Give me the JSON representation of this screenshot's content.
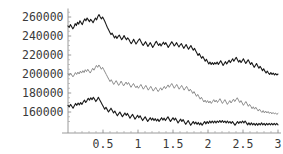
{
  "chart_data": {
    "type": "line",
    "title": "",
    "subtitle": "",
    "xlabel": "",
    "ylabel": "",
    "xlim": [
      0,
      3
    ],
    "ylim": [
      145000,
      268000
    ],
    "grid": false,
    "legend": "none",
    "axis_origin_y": 150000,
    "xticks": [
      0.5,
      1,
      1.5,
      2,
      2.5,
      3
    ],
    "xtick_labels": [
      "0.5",
      "1",
      "1.5",
      "2",
      "2.5",
      "3"
    ],
    "yticks": [
      160000,
      180000,
      200000,
      220000,
      240000,
      260000
    ],
    "ytick_labels": [
      "160000",
      "180000",
      "200000",
      "220000",
      "240000",
      "260000"
    ],
    "x_start": 0,
    "x_end": 3,
    "series": [
      {
        "name": "upper-path",
        "color": "#1a1a1a",
        "width": 1.1,
        "values": [
          250500,
          249000,
          252000,
          250000,
          247500,
          249500,
          253000,
          251000,
          254500,
          252500,
          256000,
          254000,
          252000,
          255500,
          258000,
          256000,
          259000,
          257000,
          255000,
          257500,
          256000,
          254000,
          256500,
          259000,
          257000,
          260500,
          262500,
          260000,
          258000,
          260000,
          257500,
          255000,
          252000,
          249000,
          246500,
          244000,
          241500,
          243000,
          240500,
          238000,
          240000,
          237500,
          239500,
          241000,
          238500,
          236000,
          238000,
          240500,
          238000,
          236000,
          238000,
          236500,
          234000,
          232000,
          234000,
          236500,
          234000,
          231500,
          233500,
          235500,
          237000,
          234500,
          232000,
          230000,
          232000,
          234000,
          231500,
          229000,
          231000,
          233000,
          230500,
          228000,
          230000,
          232500,
          234500,
          232000,
          230000,
          232000,
          229500,
          231500,
          233500,
          231000,
          233000,
          230500,
          228000,
          230000,
          232000,
          234000,
          232000,
          229500,
          231000,
          233000,
          230500,
          228500,
          230500,
          232000,
          229500,
          227000,
          229000,
          231000,
          228500,
          226000,
          228000,
          230000,
          227500,
          225000,
          227000,
          224500,
          222000,
          219500,
          221500,
          219000,
          216500,
          218500,
          216000,
          213500,
          215500,
          213000,
          210500,
          212500,
          210000,
          212000,
          210000,
          212000,
          210500,
          212500,
          210000,
          212000,
          214000,
          211500,
          209000,
          211000,
          213000,
          210500,
          212500,
          214500,
          212000,
          214000,
          216000,
          213500,
          215500,
          217500,
          215000,
          212500,
          214500,
          212000,
          214000,
          216000,
          213500,
          211000,
          213000,
          215000,
          212500,
          210000,
          212000,
          209500,
          207000,
          209000,
          211000,
          208500,
          206000,
          208000,
          206000,
          203500,
          205500,
          203000,
          201000,
          203000,
          201000,
          199500,
          201500,
          199500,
          201000,
          199000,
          200500,
          199000,
          200000
        ]
      },
      {
        "name": "middle-path",
        "color": "#8c8c8c",
        "width": 1.0,
        "values": [
          200000,
          198500,
          201000,
          199000,
          197000,
          199000,
          201500,
          199500,
          202000,
          200000,
          203000,
          201000,
          203500,
          201500,
          204500,
          202500,
          205000,
          203000,
          201000,
          203500,
          206000,
          204000,
          206500,
          209000,
          207000,
          209500,
          207500,
          205000,
          207000,
          204500,
          202000,
          199500,
          197000,
          194500,
          192000,
          194000,
          191500,
          189000,
          191000,
          193000,
          190500,
          188000,
          190000,
          192500,
          190000,
          187500,
          189500,
          191500,
          189000,
          191000,
          188500,
          186000,
          188000,
          190000,
          187500,
          185500,
          187500,
          185000,
          187000,
          189000,
          186500,
          184000,
          186000,
          188000,
          185500,
          183000,
          185000,
          187000,
          184500,
          182000,
          184000,
          186000,
          183500,
          181500,
          183500,
          185500,
          183000,
          185000,
          187000,
          184500,
          186500,
          188500,
          186000,
          188000,
          190000,
          187500,
          185000,
          187000,
          189000,
          186500,
          184000,
          186000,
          188000,
          185500,
          183000,
          185000,
          187000,
          184500,
          182000,
          184000,
          182000,
          179500,
          181500,
          179000,
          176500,
          178500,
          176000,
          173500,
          175500,
          173000,
          170500,
          172500,
          170000,
          172000,
          169500,
          171500,
          169000,
          171000,
          173000,
          170500,
          172500,
          170000,
          172000,
          174000,
          171500,
          169000,
          171000,
          173000,
          170500,
          168000,
          170000,
          172000,
          169500,
          171500,
          173500,
          171000,
          173000,
          175000,
          172500,
          170000,
          172000,
          169500,
          167000,
          169000,
          171000,
          168500,
          166000,
          168000,
          166000,
          163500,
          165500,
          163000,
          165000,
          163000,
          161000,
          163000,
          161000,
          159500,
          161500,
          159000,
          161000,
          159000,
          160500,
          158500,
          160000,
          158000,
          159500,
          158000,
          159000,
          157500,
          158500
        ]
      },
      {
        "name": "lower-path",
        "color": "#1a1a1a",
        "width": 1.1,
        "values": [
          167000,
          165500,
          168000,
          166000,
          164000,
          166500,
          169000,
          167000,
          169500,
          167500,
          170000,
          168000,
          170500,
          172500,
          170000,
          172000,
          174500,
          172500,
          175000,
          173000,
          175500,
          173500,
          171000,
          173000,
          175500,
          173000,
          170500,
          168000,
          165500,
          163000,
          165000,
          162500,
          160000,
          162000,
          164000,
          161500,
          159000,
          161000,
          158500,
          156000,
          158000,
          160000,
          157500,
          155000,
          157000,
          159000,
          156500,
          158500,
          156000,
          153500,
          155500,
          157500,
          155000,
          152500,
          154500,
          156500,
          154000,
          156000,
          153500,
          151000,
          153000,
          155000,
          152500,
          150000,
          152000,
          154000,
          151500,
          153500,
          151000,
          153000,
          150500,
          152500,
          150000,
          152000,
          154000,
          151500,
          153500,
          151000,
          153000,
          155000,
          152500,
          150000,
          152000,
          154000,
          151500,
          153500,
          151000,
          148500,
          150500,
          152500,
          150000,
          152000,
          149500,
          147000,
          149000,
          151000,
          148500,
          146000,
          148000,
          150000,
          147500,
          149500,
          147000,
          149000,
          146500,
          148500,
          146000,
          148000,
          150000,
          147500,
          150000,
          148000,
          150500,
          148500,
          150500,
          148500,
          150500,
          148500,
          150500,
          149000,
          151000,
          149000,
          151000,
          149000,
          150500,
          148500,
          150500,
          148500,
          150000,
          148000,
          150000,
          148000,
          146000,
          148000,
          150000,
          148000,
          150000,
          148500,
          150500,
          148500,
          150500,
          148500,
          146500,
          148500,
          146500,
          148500,
          146500,
          148000,
          146000,
          148000,
          146000,
          148000,
          146500,
          148500,
          146500,
          148000,
          146000,
          148000,
          146500,
          148000,
          146500,
          148000,
          146500,
          148000,
          146500,
          148000,
          146500
        ]
      }
    ]
  },
  "axes": {
    "axis_color": "#8f8f8f",
    "label_color": "#3a3a3a"
  }
}
